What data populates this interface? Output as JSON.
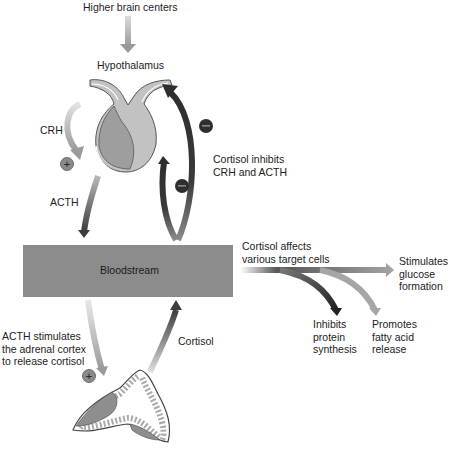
{
  "labels": {
    "higher_brain_centers": "Higher brain centers",
    "hypothalamus": "Hypothalamus",
    "crh": "CRH",
    "acth": "ACTH",
    "cortisol_inhibits": [
      "Cortisol inhibits",
      "CRH and ACTH"
    ],
    "bloodstream": "Bloodstream",
    "cortisol_affects": [
      "Cortisol affects",
      "various target cells"
    ],
    "stimulates_glucose": [
      "Stimulates",
      "glucose",
      "formation"
    ],
    "inhibits_protein": [
      "Inhibits",
      "protein",
      "synthesis"
    ],
    "promotes_fatty_acid": [
      "Promotes",
      "fatty acid",
      "release"
    ],
    "acth_stimulates": [
      "ACTH stimulates",
      "the adrenal cortex",
      "to release cortisol"
    ],
    "cortisol": "Cortisol"
  },
  "symbols": {
    "plus": "+",
    "minus": "−"
  },
  "colors": {
    "bloodstream_fill": "#8c8c8c",
    "dark_arrow": "#3a3a3a",
    "light_arrow": "#a8a8a8",
    "gland_light": "#c4c4c4",
    "gland_dark": "#9e9e9e",
    "plus_badge": "#8a8a8a",
    "minus_badge": "#2e2e2e"
  }
}
